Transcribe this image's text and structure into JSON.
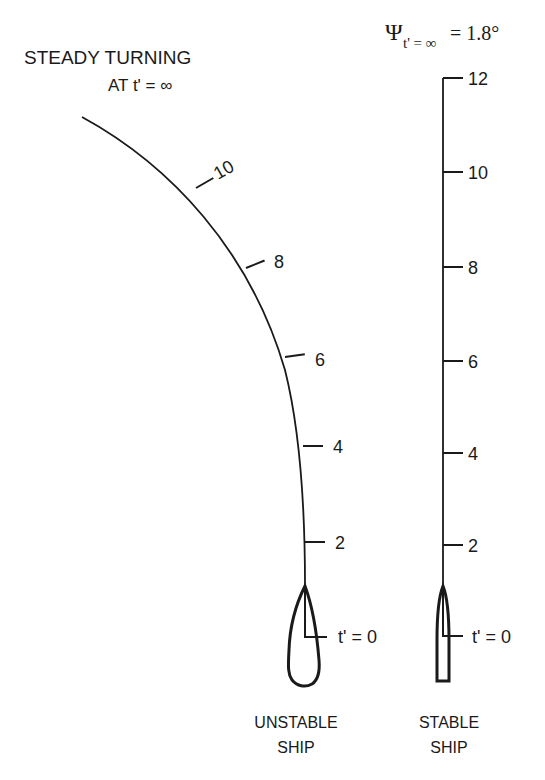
{
  "title": {
    "line1": "STEADY TURNING",
    "line2": "AT t' = ∞"
  },
  "psi_label": {
    "symbol": "Ψ",
    "subscript": "t' = ∞",
    "value": "= 1.8°"
  },
  "unstable": {
    "ticks": [
      "2",
      "4",
      "6",
      "8",
      "10"
    ],
    "start_label": "t' = 0",
    "caption_line1": "UNSTABLE",
    "caption_line2": "SHIP"
  },
  "stable": {
    "ticks": [
      "2",
      "4",
      "6",
      "8",
      "10",
      "12"
    ],
    "start_label": "t' = 0",
    "caption_line1": "STABLE",
    "caption_line2": "SHIP"
  },
  "colors": {
    "ink": "#1a1a1a",
    "background": "#ffffff"
  }
}
